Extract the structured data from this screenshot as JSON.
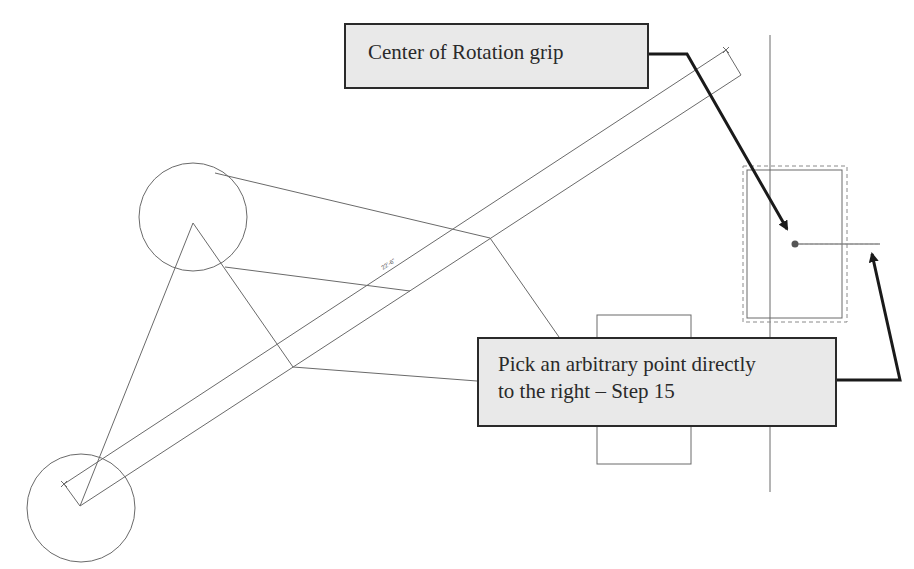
{
  "callouts": {
    "top": {
      "text": "Center of Rotation grip"
    },
    "bottom": {
      "line1": "Pick an arbitrary point directly",
      "line2": "to the right – Step 15"
    }
  },
  "dimension": {
    "label": "22'-6\""
  },
  "colors": {
    "callout_fill": "#e9e9e9",
    "callout_border": "#2a2a2a",
    "linework": "#6a6a6a",
    "leader": "#1a1a1a",
    "grip": "#555555"
  }
}
